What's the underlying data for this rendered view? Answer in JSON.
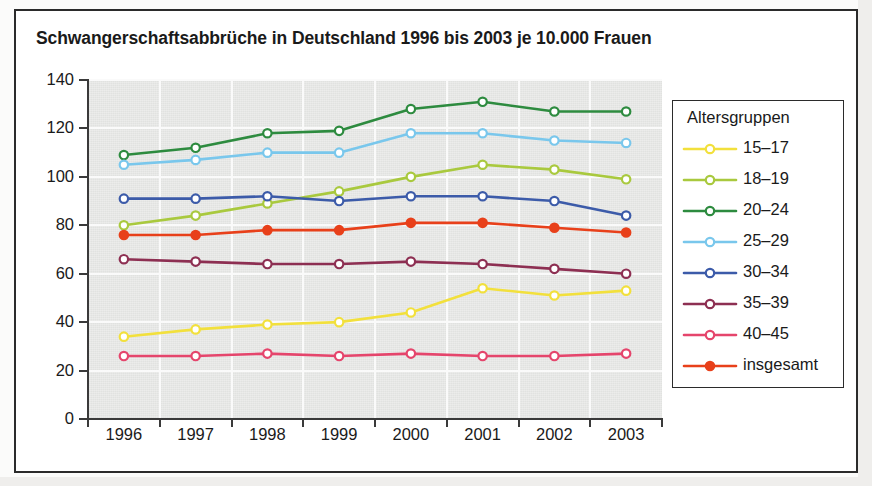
{
  "title": "Schwangerschaftsabbrüche in Deutschland 1996 bis 2003 je 10.000 Frauen",
  "legend": {
    "title": "Altersgruppen",
    "entries": [
      {
        "label": "15–17",
        "color": "#f2e03c",
        "filled": false
      },
      {
        "label": "18–19",
        "color": "#a9c93e",
        "filled": false
      },
      {
        "label": "20–24",
        "color": "#2d8b3f",
        "filled": false
      },
      {
        "label": "25–29",
        "color": "#79c7ec",
        "filled": false
      },
      {
        "label": "30–34",
        "color": "#3c5ba9",
        "filled": false
      },
      {
        "label": "35–39",
        "color": "#8d2f52",
        "filled": false
      },
      {
        "label": "40–45",
        "color": "#e5456c",
        "filled": false
      },
      {
        "label": "insgesamt",
        "color": "#e8401a",
        "filled": true
      }
    ]
  },
  "axes": {
    "y_ticks": [
      0,
      20,
      40,
      60,
      80,
      100,
      120,
      140
    ],
    "y_min": 0,
    "y_max": 140,
    "x_ticks": [
      "1996",
      "1997",
      "1998",
      "1999",
      "2000",
      "2001",
      "2002",
      "2003"
    ]
  },
  "chart_data": {
    "type": "line",
    "title": "Schwangerschaftsabbrüche in Deutschland 1996 bis 2003 je 10.000 Frauen",
    "xlabel": "",
    "ylabel": "",
    "ylim": [
      0,
      140
    ],
    "grid": true,
    "legend_position": "right",
    "legend_title": "Altersgruppen",
    "categories": [
      "1996",
      "1997",
      "1998",
      "1999",
      "2000",
      "2001",
      "2002",
      "2003"
    ],
    "series": [
      {
        "name": "15–17",
        "color": "#f2e03c",
        "values": [
          34,
          37,
          39,
          40,
          44,
          54,
          51,
          53
        ]
      },
      {
        "name": "18–19",
        "color": "#a9c93e",
        "values": [
          80,
          84,
          89,
          94,
          100,
          105,
          103,
          99
        ]
      },
      {
        "name": "20–24",
        "color": "#2d8b3f",
        "values": [
          109,
          112,
          118,
          119,
          128,
          131,
          127,
          127
        ]
      },
      {
        "name": "25–29",
        "color": "#79c7ec",
        "values": [
          105,
          107,
          110,
          110,
          118,
          118,
          115,
          114
        ]
      },
      {
        "name": "30–34",
        "color": "#3c5ba9",
        "values": [
          91,
          91,
          92,
          90,
          92,
          92,
          90,
          84
        ]
      },
      {
        "name": "35–39",
        "color": "#8d2f52",
        "values": [
          66,
          65,
          64,
          64,
          65,
          64,
          62,
          60
        ]
      },
      {
        "name": "40–45",
        "color": "#e5456c",
        "values": [
          26,
          26,
          27,
          26,
          27,
          26,
          26,
          27
        ]
      },
      {
        "name": "insgesamt",
        "color": "#e8401a",
        "values": [
          76,
          76,
          78,
          78,
          81,
          81,
          79,
          77
        ]
      }
    ]
  }
}
